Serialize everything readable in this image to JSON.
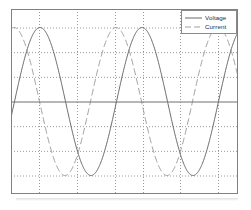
{
  "figure": {
    "background_color": "#ffffff",
    "frame_color": "#808080",
    "axis_color": "#6e6e6e",
    "grid_color": "#9a9a9a"
  },
  "legend": {
    "position": "top-right",
    "border_color": "#8a8a8a",
    "entries": [
      {
        "label": "Voltage",
        "style": "solid",
        "color": "#6b6b6b"
      },
      {
        "label": "Current",
        "style": "dashed",
        "color": "#a0a0a0"
      }
    ]
  },
  "chart_data": {
    "type": "line",
    "title": "",
    "subtitle": "",
    "xlabel": "",
    "ylabel": "",
    "xlim": [
      0,
      227
    ],
    "ylim": [
      -1.25,
      1.25
    ],
    "grid": true,
    "grid_style": "dotted",
    "x_gridlines": [
      28,
      66,
      104,
      132,
      169,
      207
    ],
    "y_gridlines": [
      -1.0,
      -0.667,
      -0.333,
      0.0,
      0.333,
      0.667,
      1.0
    ],
    "zero_axis": 0.0,
    "legend_position": "upper right",
    "x_tick_labels": [],
    "y_tick_labels": [],
    "series": [
      {
        "name": "Voltage",
        "style": "solid",
        "color": "#6b6b6b",
        "amplitude": 1.0,
        "period_px": 102,
        "phase_deg": 0,
        "peak_x_px": [
          29,
          131
        ],
        "trough_x_px": [
          80,
          182
        ]
      },
      {
        "name": "Current",
        "style": "dashed",
        "color": "#a0a0a0",
        "amplitude": 1.0,
        "period_px": 102,
        "phase_deg": 92,
        "peak_x_px": [
          3,
          105,
          207
        ],
        "trough_x_px": [
          54,
          156
        ]
      }
    ]
  }
}
